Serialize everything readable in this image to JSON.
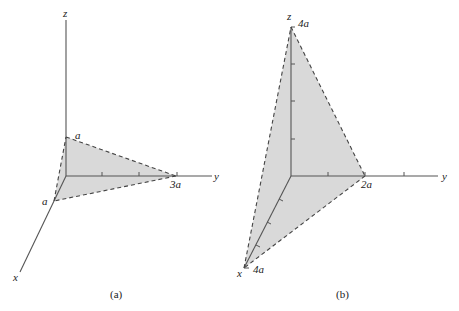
{
  "figures": [
    {
      "caption": "(a)",
      "axes": {
        "x": "x",
        "y": "y",
        "z": "z"
      },
      "intercepts": {
        "x": "a",
        "y": "3a",
        "z": "a"
      },
      "plane": "triangle through (a,0,0), (0,3a,0), (0,0,a)"
    },
    {
      "caption": "(b)",
      "axes": {
        "x": "x",
        "y": "y",
        "z": "z"
      },
      "intercepts": {
        "x": "4a",
        "y": "2a",
        "z": "4a"
      },
      "plane": "triangle through (4a,0,0), (0,2a,0), (0,0,4a)"
    }
  ],
  "colors": {
    "plane_fill": "#d9d9d9",
    "axis": "#555555",
    "edge": "#444444"
  }
}
